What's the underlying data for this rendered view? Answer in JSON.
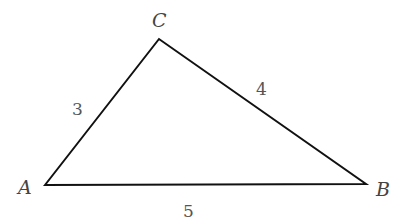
{
  "diagram": {
    "type": "triangle",
    "vertices": [
      {
        "name": "A",
        "x": 45,
        "y": 185,
        "label_x": 18,
        "label_y": 194
      },
      {
        "name": "B",
        "x": 366,
        "y": 184,
        "label_x": 376,
        "label_y": 196
      },
      {
        "name": "C",
        "x": 159,
        "y": 39,
        "label_x": 152,
        "label_y": 27
      }
    ],
    "sides": [
      {
        "between": "AC",
        "length": "3",
        "label_x": 72,
        "label_y": 115
      },
      {
        "between": "CB",
        "length": "4",
        "label_x": 256,
        "label_y": 95
      },
      {
        "between": "AB",
        "length": "5",
        "label_x": 183,
        "label_y": 217
      }
    ],
    "stroke_color": "#111111"
  }
}
